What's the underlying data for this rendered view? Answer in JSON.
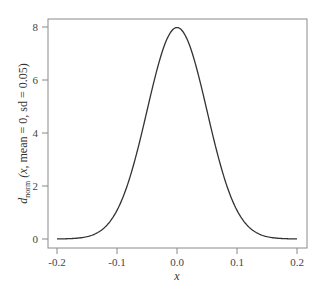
{
  "chart_data": {
    "type": "line",
    "title": "",
    "xlabel": "x",
    "ylabel": "d_norm (x, mean = 0, sd = 0.05)",
    "ylabel_parts": {
      "main": "d",
      "subscript": "norm",
      "args_italic": "(x,",
      "args_rest": " mean = 0, sd = 0.05)"
    },
    "xlim": [
      -0.2,
      0.2
    ],
    "ylim": [
      0,
      8
    ],
    "x_ticks": [
      -0.2,
      -0.1,
      0.0,
      0.1,
      0.2
    ],
    "x_tick_labels": [
      "-0.2",
      "-0.1",
      "0.0",
      "0.1",
      "0.2"
    ],
    "y_ticks": [
      0,
      2,
      4,
      6,
      8
    ],
    "y_tick_labels": [
      "0",
      "2",
      "4",
      "6",
      "8"
    ],
    "grid": false,
    "legend": null,
    "series": [
      {
        "name": "normal density mean=0 sd=0.05",
        "x": [
          -0.2,
          -0.175,
          -0.15,
          -0.125,
          -0.1,
          -0.075,
          -0.05,
          -0.025,
          0.0,
          0.025,
          0.05,
          0.075,
          0.1,
          0.125,
          0.15,
          0.175,
          0.2
        ],
        "y": [
          0.0027,
          0.0175,
          0.0886,
          0.3505,
          1.0798,
          2.5904,
          4.8394,
          7.0413,
          7.9788,
          7.0413,
          4.8394,
          2.5904,
          1.0798,
          0.3505,
          0.0886,
          0.0175,
          0.0027
        ]
      }
    ],
    "distribution": {
      "mean": 0,
      "sd": 0.05
    },
    "line_color": "#333333",
    "axis_color": "#888888"
  }
}
